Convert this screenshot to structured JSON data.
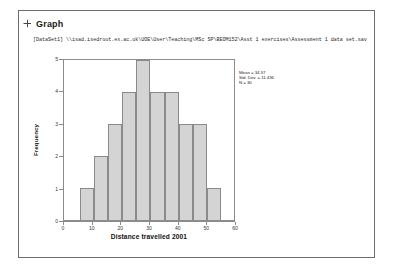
{
  "window": {
    "background_color": "#ffffff",
    "panel_border_color": "#6b6b6b"
  },
  "header": {
    "expand_icon": "expand-plus-icon",
    "title": "Graph"
  },
  "dataset": {
    "path": "[DataSet1] \\\\isad.isedroot.ex.ac.uk\\UOE\\User\\Teaching\\MSc SP\\BEOM152\\Asst 1 exercises\\Assessment 1 data set.sav"
  },
  "stats": {
    "lines": [
      "Mean = 34.37",
      "Std. Dev. = 11.436",
      "N = 30"
    ]
  },
  "chart_data": {
    "type": "bar",
    "title": "",
    "subtitle": "",
    "xlabel": "Distance travelled 2001",
    "ylabel": "Frequency",
    "grid": false,
    "legend": false,
    "bar_fill_color": "#d4d4d4",
    "bar_border_color": "#8a8a8a",
    "categories": [
      "5",
      "10",
      "15",
      "20",
      "25",
      "30",
      "35",
      "40",
      "45",
      "50"
    ],
    "values": [
      1,
      2,
      3,
      4,
      5,
      4,
      4,
      3,
      3,
      1
    ],
    "xlim": [
      0,
      60
    ],
    "ylim": [
      0,
      5
    ],
    "xticks": [
      0,
      10,
      20,
      30,
      40,
      50,
      60
    ],
    "xtick_labels": [
      "0",
      "10",
      "20",
      "30",
      "40",
      "50",
      "60"
    ],
    "yticks": [
      0,
      1,
      2,
      3,
      4,
      5
    ],
    "ytick_labels": [
      "0",
      "1",
      "2",
      "3",
      "4",
      "5"
    ],
    "bin_start": 7.5,
    "bin_width": 5,
    "annotations": [
      "Mean = 34.37",
      "Std. Dev. = 11.436",
      "N = 30"
    ]
  }
}
